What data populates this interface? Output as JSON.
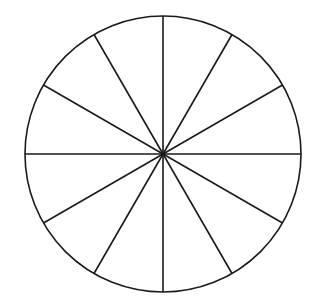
{
  "diagram": {
    "type": "circle-divided-into-sectors",
    "sectors": 12,
    "angle_step_deg": 30,
    "center": [
      163,
      154
    ],
    "radius": 138,
    "stroke_color": "#1a1a1a",
    "fill_color": "#ffffff",
    "stroke_width": 1.6
  }
}
